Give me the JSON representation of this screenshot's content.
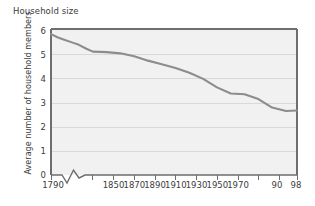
{
  "chart_data": {
    "type": "line",
    "title": "Household size",
    "xlabel": "",
    "ylabel": "Average number of household members",
    "ylim": [
      0,
      6
    ],
    "xlim": [
      1790,
      1998
    ],
    "grid": true,
    "legend": null,
    "axis_break": "between 1790 and 1850",
    "y_ticks": [
      "6",
      "5",
      "4",
      "3",
      "2",
      "1",
      "0"
    ],
    "y_tick_values": [
      6,
      5,
      4,
      3,
      2,
      1,
      0
    ],
    "x_ticks": [
      "1790",
      "1850",
      "1870",
      "1890",
      "1910",
      "1930",
      "1950",
      "1970",
      "90",
      "98"
    ],
    "x_tick_values": [
      1790,
      1850,
      1870,
      1890,
      1910,
      1930,
      1950,
      1970,
      1990,
      1998
    ],
    "x": [
      1790,
      1800,
      1810,
      1820,
      1830,
      1840,
      1850,
      1860,
      1870,
      1880,
      1890,
      1900,
      1910,
      1920,
      1930,
      1940,
      1950,
      1960,
      1970,
      1980,
      1990,
      1998
    ],
    "values": [
      5.79,
      5.65,
      5.55,
      5.45,
      5.35,
      5.2,
      5.07,
      5.05,
      5.0,
      4.88,
      4.7,
      4.55,
      4.4,
      4.2,
      3.95,
      3.6,
      3.35,
      3.32,
      3.12,
      2.77,
      2.63,
      2.65
    ],
    "series": [
      {
        "name": "Average number of household members",
        "color": "#8c8c8c",
        "values": [
          5.79,
          5.65,
          5.55,
          5.45,
          5.35,
          5.2,
          5.07,
          5.05,
          5.0,
          4.88,
          4.7,
          4.55,
          4.4,
          4.2,
          3.95,
          3.6,
          3.35,
          3.32,
          3.12,
          2.77,
          2.63,
          2.65
        ]
      }
    ],
    "colors": {
      "line": "#8c8c8c",
      "plot_background": "#f1f1f1",
      "gridline": "#d9d9d9",
      "frame": "#6e6e6e",
      "text": "#3c3c3c"
    }
  }
}
